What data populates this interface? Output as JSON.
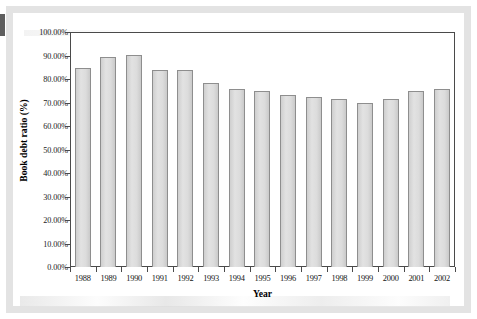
{
  "figure": {
    "kind": "bar-chart-figure",
    "background_color": "#ffffff",
    "frame_color": "#e3e3e3"
  },
  "chart_data": {
    "type": "bar",
    "title": "",
    "xlabel": "Year",
    "ylabel": "Book debt ratio (%)",
    "categories": [
      "1988",
      "1989",
      "1990",
      "1991",
      "1992",
      "1993",
      "1994",
      "1995",
      "1996",
      "1997",
      "1998",
      "1999",
      "2000",
      "2001",
      "2002"
    ],
    "values": [
      84.5,
      89.2,
      90.4,
      83.7,
      83.7,
      78.3,
      75.8,
      74.8,
      73.1,
      72.3,
      71.4,
      69.8,
      71.4,
      74.8,
      75.9
    ],
    "value_unit": "percent",
    "ylim": [
      0,
      100
    ],
    "ytick_values": [
      0,
      10,
      20,
      30,
      40,
      50,
      60,
      70,
      80,
      90,
      100
    ],
    "ytick_labels": [
      "0.00%",
      "10.00%",
      "20.00%",
      "30.00%",
      "40.00%",
      "50.00%",
      "60.00%",
      "70.00%",
      "80.00%",
      "90.00%",
      "100.00%"
    ],
    "grid": false,
    "legend": null,
    "legend_position": "none",
    "bar_fill_color": "#d9d9d9",
    "bar_border_color": "#8e8e8e",
    "axis_color": "#4a4a4a"
  }
}
